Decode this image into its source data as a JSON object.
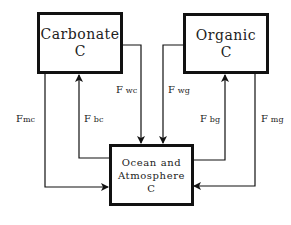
{
  "diagram": {
    "nodes": {
      "carbonate": {
        "line1": "Carbonate",
        "line2": "C"
      },
      "organic": {
        "line1": "Organic",
        "line2": "C"
      },
      "ocean": {
        "line1": "Ocean and",
        "line2": "Atmosphere",
        "line3": "C"
      }
    },
    "fluxes": {
      "fmc": {
        "F": "F",
        "sub": "mc",
        "from": "Carbonate C",
        "to": "Ocean and Atmosphere C"
      },
      "fbc": {
        "F": "F",
        "sub": "bc",
        "from": "Ocean and Atmosphere C",
        "to": "Carbonate C"
      },
      "fwc": {
        "F": "F",
        "sub": "wc",
        "from": "Carbonate C",
        "to": "Ocean and Atmosphere C"
      },
      "fwg": {
        "F": "F",
        "sub": "wg",
        "from": "Organic C",
        "to": "Ocean and Atmosphere C"
      },
      "fbg": {
        "F": "F",
        "sub": "bg",
        "from": "Ocean and Atmosphere C",
        "to": "Organic C"
      },
      "fmg": {
        "F": "F",
        "sub": "mg",
        "from": "Organic C",
        "to": "Ocean and Atmosphere C"
      }
    },
    "colors": {
      "line": "#111111",
      "background": "#ffffff"
    }
  }
}
